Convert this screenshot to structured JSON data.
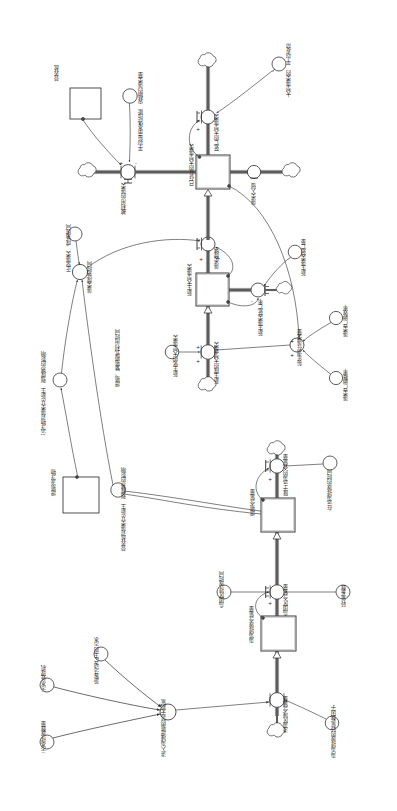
{
  "diagram": {
    "type": "system-dynamics-stock-flow",
    "orientation": "rotated-90",
    "background_color": "#ffffff",
    "line_color": "#3a3a3a",
    "text_color": "#262626"
  },
  "stocks": [
    {
      "id": "stock-nutrient-salt",
      "label": "营养盐",
      "x": 72,
      "y": 104
    },
    {
      "id": "stock-existing-macroalgae",
      "label": "已存在的大型藻类",
      "x": 208,
      "y": 172
    },
    {
      "id": "stock-new-macroalgae",
      "label": "新生大型藻类",
      "x": 208,
      "y": 290
    },
    {
      "id": "stock-suspended-matter",
      "label": "增殖流浮物",
      "x": 72,
      "y": 492
    },
    {
      "id": "stock-nitrogen-proliferation",
      "label": "增殖含氮量",
      "x": 276,
      "y": 515
    },
    {
      "id": "stock-island-nitrogen",
      "label": "海海排放含氮量",
      "x": 276,
      "y": 633
    }
  ],
  "flows": [
    {
      "id": "flow-utilized-algae",
      "label": "被利用的藻类",
      "x": 124,
      "y": 172
    },
    {
      "id": "flow-dead-macroalgae",
      "label": "死亡的大型藻类",
      "x": 188,
      "y": 98
    },
    {
      "id": "flow-algae-invasion",
      "label": "藻类入侵",
      "x": 243,
      "y": 172
    },
    {
      "id": "flow-algae-maturation",
      "label": "藻类成熟",
      "x": 208,
      "y": 250
    },
    {
      "id": "flow-newborn-generated",
      "label": "新生成的大型藻类",
      "x": 208,
      "y": 352
    },
    {
      "id": "flow-newborn-death-rate",
      "label": "新生藻类死亡率",
      "x": 252,
      "y": 290
    },
    {
      "id": "flow-algae-maturity-time",
      "label": "藻类成熟时间",
      "x": 76,
      "y": 270
    },
    {
      "id": "flow-nitrogen-to-sea",
      "label": "降于远海的含氮量",
      "x": 263,
      "y": 455
    },
    {
      "id": "flow-island-discharge",
      "label": "岛国区含氮量",
      "x": 263,
      "y": 592
    },
    {
      "id": "flow-total-sewage-in",
      "label": "进入海域增殖的总无机氮",
      "x": 168,
      "y": 710
    },
    {
      "id": "flow-island-area-n",
      "label": "浅海区域含氮量",
      "x": 263,
      "y": 700
    }
  ],
  "auxiliaries": [
    {
      "id": "aux-avg-lifespan",
      "label": "大型藻类的\n平均寿命",
      "x": 284,
      "y": 48
    },
    {
      "id": "aux-water-capacity",
      "label": "平均每亩水体所能\n容纳的藻类量",
      "x": 138,
      "y": 98
    },
    {
      "id": "aux-normal-maturity-time",
      "label": "正常藻类\n成熟时间",
      "x": 72,
      "y": 232
    },
    {
      "id": "aux-newborn-mortality",
      "label": "新生藻类死亡量",
      "x": 300,
      "y": 244
    },
    {
      "id": "aux-annual-potential",
      "label": "每年潜在藻类量",
      "x": 328,
      "y": 340
    },
    {
      "id": "aux-spawn-efficiency",
      "label": "藻类产卵效率",
      "x": 344,
      "y": 306
    },
    {
      "id": "aux-spawn-rate",
      "label": "藻类产卵概率",
      "x": 344,
      "y": 380
    },
    {
      "id": "aux-newborn-source",
      "label": "新生化的大型藻类",
      "x": 188,
      "y": 340
    },
    {
      "id": "aux-breed-use-time",
      "label": "增殖、繁殖模式利用时间",
      "x": 104,
      "y": 352
    },
    {
      "id": "aux-nutrient-effect",
      "label": "营养盐对藻类从新生\n到成熟的影响",
      "x": 112,
      "y": 480
    },
    {
      "id": "aux-suspended-effect",
      "label": "沉浮物对藻类从新生\n到成熟的影响",
      "x": 52,
      "y": 374
    },
    {
      "id": "aux-far-sea-time",
      "label": "在远海排放的时间",
      "x": 316,
      "y": 462
    },
    {
      "id": "aux-island-discharge-time",
      "label": "岛国区排放时间",
      "x": 214,
      "y": 592
    },
    {
      "id": "aux-n-coefficient",
      "label": "转氮系数",
      "x": 340,
      "y": 600
    },
    {
      "id": "aux-tourist-sewage",
      "label": "游客活动产生的污水",
      "x": 92,
      "y": 655
    },
    {
      "id": "aux-sewage-treatment",
      "label": "污水处理机",
      "x": 38,
      "y": 668
    },
    {
      "id": "aux-sewage-discharge",
      "label": "污水排放数量",
      "x": 34,
      "y": 730
    },
    {
      "id": "aux-island-n-factor",
      "label": "海海排放的转氮数因子",
      "x": 300,
      "y": 740
    }
  ],
  "polarities": [
    "+",
    "-",
    "+",
    "+",
    "+",
    "-",
    "+",
    "+",
    "+",
    "+",
    "+",
    "+",
    "+"
  ],
  "legend": {
    "stock_shape": "rectangle",
    "flow_shape": "valve-circle",
    "aux_shape": "circle",
    "cloud_shape": "cloud-source-sink"
  }
}
